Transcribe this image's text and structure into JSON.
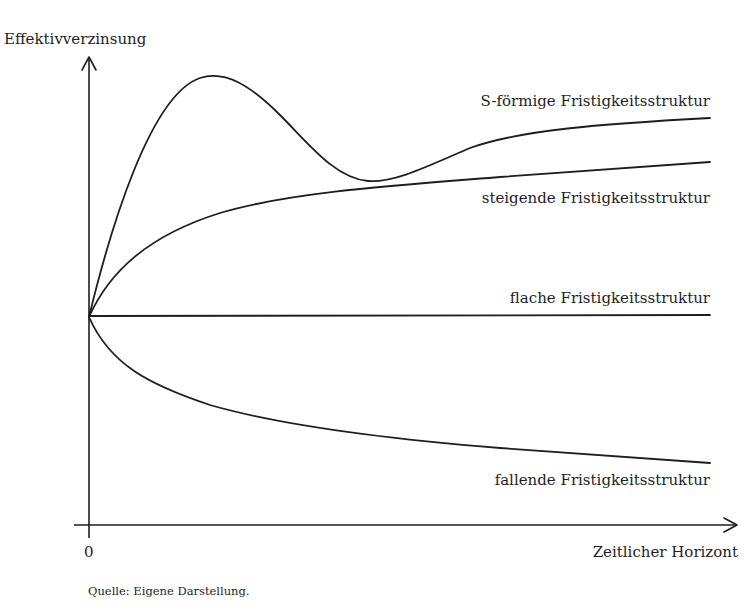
{
  "diagram": {
    "y_axis_label": "Effektivverzinsung",
    "x_axis_label": "Zeitlicher Horizont",
    "origin_label": "0",
    "source_note": "Quelle: Eigene Darstellung.",
    "curves": [
      {
        "id": "s-shaped",
        "label": "S-förmige Fristigkeitsstruktur",
        "shape": "rises sharply to a peak, dips to a trough, then rises gently"
      },
      {
        "id": "rising",
        "label": "steigende Fristigkeitsstruktur",
        "shape": "concave increasing"
      },
      {
        "id": "flat",
        "label": "flache Fristigkeitsstruktur",
        "shape": "constant"
      },
      {
        "id": "falling",
        "label": "fallende Fristigkeitsstruktur",
        "shape": "convex decreasing"
      }
    ],
    "colors": {
      "line": "#1e1e1e",
      "background": "#ffffff"
    }
  }
}
